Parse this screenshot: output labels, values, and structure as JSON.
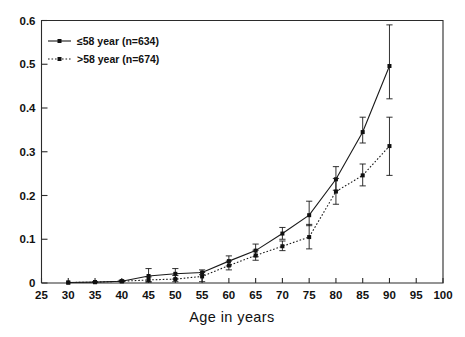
{
  "chart_data": {
    "type": "line",
    "title": "",
    "xlabel": "Age in years",
    "ylabel": "",
    "xlim": [
      25,
      100
    ],
    "ylim": [
      0,
      0.6
    ],
    "grid": false,
    "legend_position": "top-left",
    "x_ticks": [
      25,
      30,
      35,
      40,
      45,
      50,
      55,
      60,
      65,
      70,
      75,
      80,
      85,
      90,
      95,
      100
    ],
    "x_tick_labels": [
      "25",
      "30",
      "35",
      "40",
      "45",
      "50",
      "55",
      "60",
      "65",
      "70",
      "75",
      "80",
      "85",
      "90",
      "95",
      "100"
    ],
    "y_ticks": [
      0,
      0.1,
      0.2,
      0.3,
      0.4,
      0.5,
      0.6
    ],
    "y_tick_labels": [
      "0",
      "0.1",
      "0.2",
      "0.3",
      "0.4",
      "0.5",
      "0.6"
    ],
    "x": [
      30,
      35,
      40,
      45,
      50,
      55,
      60,
      65,
      70,
      75,
      80,
      85,
      90
    ],
    "series": [
      {
        "name": "≤58 year (n=634)",
        "style": "solid",
        "marker": "filled-square",
        "values": [
          0.001,
          0.002,
          0.004,
          0.016,
          0.021,
          0.024,
          0.05,
          0.074,
          0.113,
          0.155,
          0.237,
          0.345,
          0.496
        ],
        "err_low": [
          0.001,
          0.002,
          0.003,
          0.003,
          0.009,
          0.019,
          0.039,
          0.06,
          0.1,
          0.131,
          0.212,
          0.32,
          0.421
        ],
        "err_high": [
          0.002,
          0.003,
          0.006,
          0.033,
          0.033,
          0.03,
          0.062,
          0.089,
          0.127,
          0.187,
          0.266,
          0.379,
          0.59
        ]
      },
      {
        "name": ">58 year (n=674)",
        "style": "dotted",
        "marker": "filled-square",
        "values": [
          0.001,
          0.002,
          0.004,
          0.007,
          0.009,
          0.015,
          0.04,
          0.063,
          0.084,
          0.105,
          0.209,
          0.246,
          0.313
        ],
        "err_low": [
          0.001,
          0.001,
          0.003,
          0.002,
          0.003,
          0.003,
          0.03,
          0.052,
          0.074,
          0.078,
          0.18,
          0.222,
          0.246
        ],
        "err_high": [
          0.002,
          0.003,
          0.006,
          0.014,
          0.017,
          0.024,
          0.05,
          0.075,
          0.096,
          0.134,
          0.239,
          0.272,
          0.379
        ]
      }
    ]
  },
  "legend": {
    "entries": [
      {
        "label": "≤58 year (n=634)",
        "style": "solid"
      },
      {
        "label": ">58 year (n=674)",
        "style": "dotted"
      }
    ]
  },
  "axis": {
    "x_title": "Age in years"
  },
  "colors": {
    "ink": "#1a1a1a",
    "background": "#ffffff"
  }
}
